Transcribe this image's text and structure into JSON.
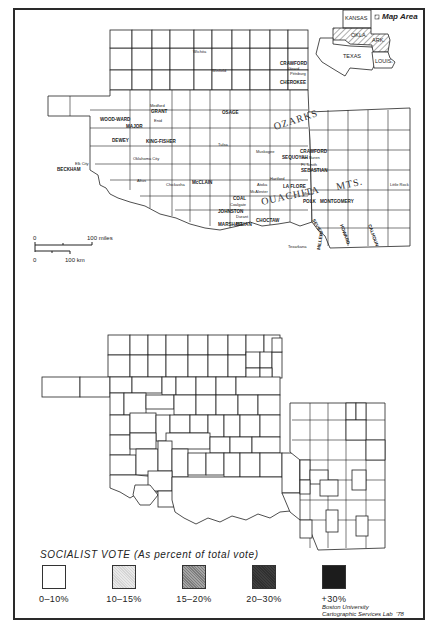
{
  "header_note": "Boston University Cartographic Services Lab map",
  "inset": {
    "label": "Map Area",
    "states": [
      "KANSAS",
      "OKLA.",
      "ARK.",
      "TEXAS",
      "LOUIS."
    ]
  },
  "reference_map": {
    "place_labels": [
      "Wichita",
      "Winfield",
      "CRAWFORD",
      "Girard",
      "Pittsburg",
      "CHEROKEE",
      "Medford",
      "GRANT",
      "Enid",
      "OSAGE",
      "WOOD-WARD",
      "MAJOR",
      "DEWEY",
      "KING-FISHER",
      "Oklahoma City",
      "Elk City",
      "BECKHAM",
      "Altus",
      "Chickasha",
      "McCLAIN",
      "Tulsa",
      "Muskogee",
      "SEQUOYAH",
      "CRAWFORD",
      "Van Buren",
      "Ft. Smith",
      "SEBASTIAN",
      "Hartford",
      "LA FLORE",
      "McAlester",
      "Atoka",
      "COAL",
      "Coalgate",
      "JOHNSTON",
      "MARSHALL",
      "Durant",
      "BRYAN",
      "CHOCTAW",
      "Mena",
      "POLK",
      "MONTGOMERY",
      "Texarkana",
      "Little Rock",
      "SEVIER",
      "HOWARD",
      "MILLER",
      "CALHOUN"
    ],
    "region_labels": [
      "OZARKS",
      "OUACHITA",
      "MTS."
    ],
    "scale": {
      "miles_label": "100 miles",
      "km_label": "100 km",
      "zero_label": "0"
    }
  },
  "legend": {
    "title": "SOCIALIST VOTE (As percent of total vote)",
    "classes": [
      {
        "label": "0–10%",
        "color": "#ffffff"
      },
      {
        "label": "10–15%",
        "color": "#e4e4e4"
      },
      {
        "label": "15–20%",
        "color": "#9a9a9a"
      },
      {
        "label": "20–30%",
        "color": "#3a3a3a"
      },
      {
        "label": "+30%",
        "color": "#1c1c1c"
      }
    ]
  },
  "credit": {
    "line1": "Boston University",
    "line2": "Cartographic Services Lab",
    "year": "'78"
  }
}
